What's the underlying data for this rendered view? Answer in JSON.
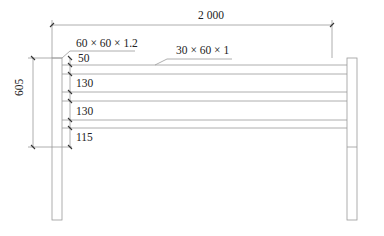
{
  "drawing": {
    "type": "fence elevation",
    "overall_width_label": "2 000",
    "overall_height_label": "605",
    "post_section_label": "60 × 60 × 1.2",
    "rail_section_label": "30 × 60 × 1",
    "spacing_labels": [
      "50",
      "130",
      "130",
      "115"
    ]
  }
}
